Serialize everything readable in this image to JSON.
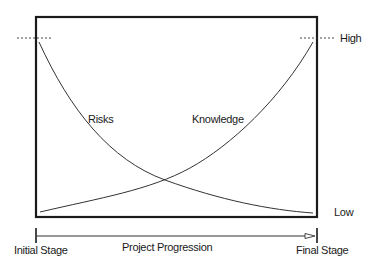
{
  "diagram": {
    "title": "",
    "curves": [
      {
        "name": "Risks",
        "label": "Risks",
        "trend": "decreasing",
        "start_level": "High",
        "end_level": "Low"
      },
      {
        "name": "Knowledge",
        "label": "Knowledge",
        "trend": "increasing",
        "start_level": "Low",
        "end_level": "High"
      }
    ],
    "y_levels": {
      "high": "High",
      "low": "Low"
    },
    "x_axis": {
      "start_label": "Initial Stage",
      "end_label": "Final Stage",
      "axis_label": "Project Progression"
    },
    "colors": {
      "line": "#1a1a1a",
      "curve": "#333333",
      "background": "#ffffff"
    }
  }
}
